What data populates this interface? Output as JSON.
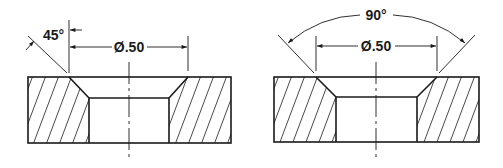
{
  "figures": [
    {
      "id": "left",
      "description": "Countersunk hole section, angle dimensioned from surface",
      "angle_label": "45°",
      "diameter_label": "Ø.50"
    },
    {
      "id": "right",
      "description": "Countersunk hole section, included angle dimensioned",
      "angle_label": "90°",
      "diameter_label": "Ø.50"
    }
  ],
  "colors": {
    "line": "#1a1a1a",
    "background": "#ffffff"
  }
}
